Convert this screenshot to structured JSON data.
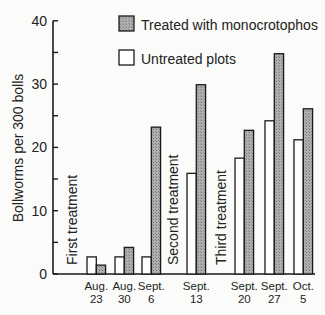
{
  "chart_data": {
    "type": "bar",
    "title": "",
    "xlabel": "",
    "ylabel": "Bollworms per 300 bolls",
    "ylim": [
      0,
      40
    ],
    "yticks": [
      0,
      10,
      20,
      30,
      40
    ],
    "grid": false,
    "legend_position": "top-right",
    "categories": [
      {
        "line1": "Aug.",
        "line2": "23"
      },
      {
        "line1": "Aug.",
        "line2": "30"
      },
      {
        "line1": "Sept.",
        "line2": "6"
      },
      {
        "line1": "Sept.",
        "line2": "13"
      },
      {
        "line1": "Sept.",
        "line2": "20"
      },
      {
        "line1": "Sept.",
        "line2": "27"
      },
      {
        "line1": "Oct.",
        "line2": "5"
      }
    ],
    "series": [
      {
        "name": "Untreated plots",
        "style": "white",
        "values": [
          2.7,
          2.7,
          2.7,
          15.9,
          18.3,
          24.2,
          21.2
        ]
      },
      {
        "name": "Treated with monocrotophos",
        "style": "gray-hatched",
        "values": [
          1.4,
          4.2,
          23.2,
          29.9,
          22.7,
          34.8,
          26.1
        ]
      }
    ],
    "annotations": [
      "First treatment",
      "Second treatment",
      "Third treatment"
    ]
  },
  "legend": {
    "treated": "Treated with monocrotophos",
    "untreated": "Untreated plots"
  },
  "colors": {
    "treated_fill": "#a8a8a8",
    "untreated_fill": "#ffffff",
    "stroke": "#1a1a1a"
  }
}
